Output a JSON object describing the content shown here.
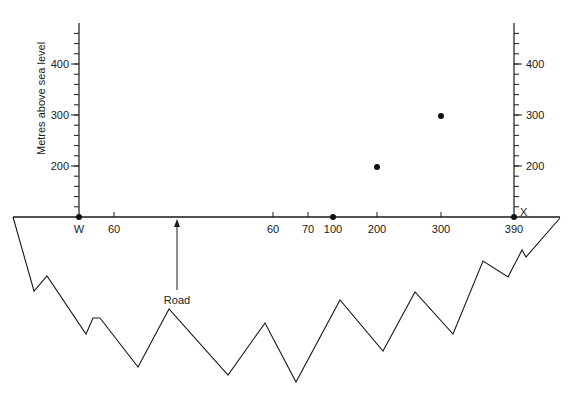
{
  "diagram": {
    "type": "cross-section profile",
    "y_axis_title": "Metres above sea level",
    "y_ticks_left": [
      {
        "label": "400",
        "y": 64
      },
      {
        "label": "300",
        "y": 115
      },
      {
        "label": "200",
        "y": 166
      }
    ],
    "y_ticks_right": [
      {
        "label": "400",
        "y": 64
      },
      {
        "label": "300",
        "y": 115
      },
      {
        "label": "200",
        "y": 166
      }
    ],
    "x_labels": [
      {
        "label": "W",
        "x": 79
      },
      {
        "label": "60",
        "x": 114
      },
      {
        "label": "60",
        "x": 273
      },
      {
        "label": "70",
        "x": 308
      },
      {
        "label": "100",
        "x": 333
      },
      {
        "label": "200",
        "x": 377
      },
      {
        "label": "300",
        "x": 441
      },
      {
        "label": "390",
        "x": 514
      }
    ],
    "end_label": "X",
    "road_label": "Road",
    "points": [
      {
        "name": "W",
        "x": 79,
        "y": 217
      },
      {
        "name": "100",
        "x": 333,
        "y": 217
      },
      {
        "name": "200-height",
        "x": 377,
        "y": 167
      },
      {
        "name": "300-height",
        "x": 441,
        "y": 116
      },
      {
        "name": "X",
        "x": 514,
        "y": 217
      }
    ],
    "profile_polyline": "13,217 34,291 47,276 86,334 93,318 100,318 138,367 169,309 228,375 265,323 296,382 340,300 383,351 415,292 453,334 483,261 508,277 522,250 526,257 560,218",
    "colors": {
      "line": "#1a1a1a",
      "background": "#ffffff"
    }
  }
}
